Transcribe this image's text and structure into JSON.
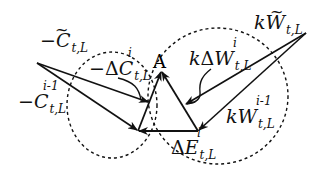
{
  "diagram": {
    "vertex_label": "A",
    "labels": {
      "c_tilde": {
        "sign": "−",
        "symbol": "C",
        "tilde": "~",
        "sub": "t,L"
      },
      "c_prev": {
        "sign": "−",
        "symbol": "C",
        "sub": "t,L",
        "sup": "i-1"
      },
      "delta_c": {
        "sign": "−",
        "delta": "Δ",
        "symbol": "C",
        "sub": "t,L",
        "sup": "i"
      },
      "w_tilde": {
        "coef": "k",
        "symbol": "W",
        "tilde": "~",
        "sub": "t,L"
      },
      "delta_w": {
        "coef": "k",
        "delta": "Δ",
        "symbol": "W",
        "sub": "t,L",
        "sup": "i"
      },
      "w_prev": {
        "coef": "k",
        "symbol": "W",
        "sub": "t,L",
        "sup": "i-1"
      },
      "delta_e": {
        "delta": "Δ",
        "symbol": "E",
        "sub": "t,L",
        "sup": "i"
      }
    },
    "colors": {
      "stroke": "#111111",
      "background": "#ffffff"
    }
  }
}
